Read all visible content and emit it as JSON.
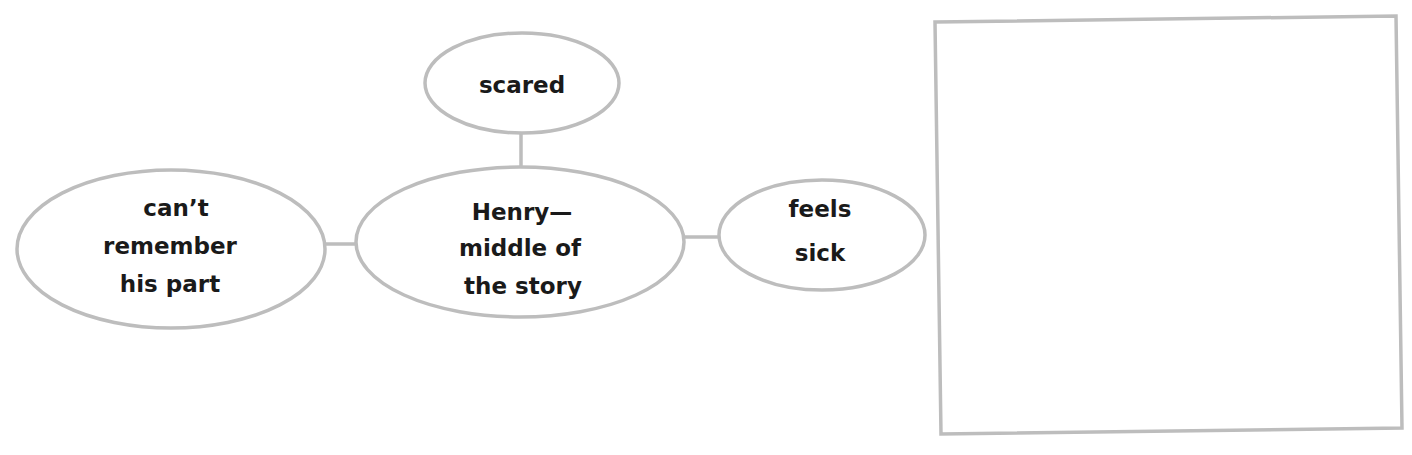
{
  "diagram": {
    "type": "web-organizer",
    "colors": {
      "stroke": "#bdbdbd",
      "text": "#1a1a1a",
      "background": "#ffffff"
    },
    "center_node": {
      "lines": [
        "Henry—",
        "middle of",
        "the story"
      ]
    },
    "nodes": {
      "top": {
        "lines": [
          "scared"
        ]
      },
      "left": {
        "lines": [
          "can’t",
          "remember",
          "his part"
        ]
      },
      "right": {
        "lines": [
          "feels",
          "sick"
        ]
      }
    },
    "answer_box": {
      "content": ""
    }
  }
}
